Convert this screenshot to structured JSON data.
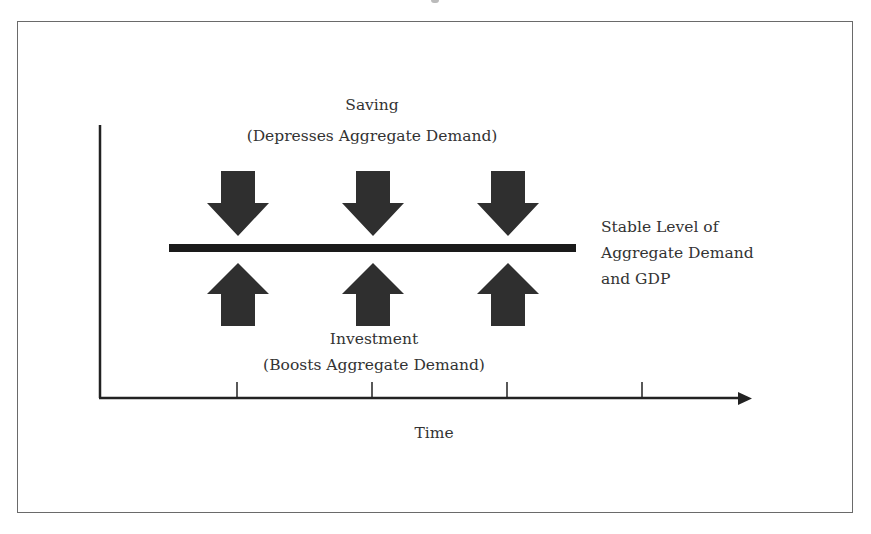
{
  "diagram": {
    "type": "flow-balance-diagram",
    "colors": {
      "arrow_fill": "#2f2f2f",
      "bar_fill": "#1a1a1a",
      "axis_stroke": "#222222",
      "frame_stroke": "#6a6a6a",
      "text": "#333333"
    },
    "saving": {
      "title": "Saving",
      "subtitle": "(Depresses Aggregate Demand)",
      "arrow_direction": "down",
      "arrow_count": 3
    },
    "investment": {
      "title": "Investment",
      "subtitle": "(Boosts Aggregate Demand)",
      "arrow_direction": "up",
      "arrow_count": 3
    },
    "stable_level": {
      "line1": "Stable Level of",
      "line2": "Aggregate Demand",
      "line3": "and GDP"
    },
    "x_axis": {
      "label": "Time",
      "tick_count": 4
    },
    "arrow_x_positions": [
      238,
      373,
      508
    ],
    "tick_x_positions": [
      237,
      372,
      507,
      642
    ]
  }
}
